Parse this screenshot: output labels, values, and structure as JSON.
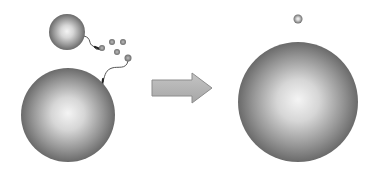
{
  "diagram": {
    "title": "",
    "colors": {
      "background": "#ffffff",
      "sphere_center": "#f2f2f2",
      "sphere_edge": "#6e6e6e",
      "arrow_fill": "#b4b4b4",
      "arrow_stroke": "#8c8c8c",
      "tether": "#555555",
      "small_dot": "#7a7a7a"
    },
    "left_panel": {
      "small_sphere": {
        "cx": 67,
        "cy": 32,
        "r": 18
      },
      "large_sphere": {
        "cx": 68,
        "cy": 115,
        "r": 47
      },
      "free_dots": [
        {
          "cx": 112,
          "cy": 42,
          "r": 3
        },
        {
          "cx": 123,
          "cy": 42,
          "r": 3
        },
        {
          "cx": 117,
          "cy": 52,
          "r": 3
        },
        {
          "cx": 128,
          "cy": 58,
          "r": 3.5
        }
      ]
    },
    "arrow": {
      "label": "",
      "direction": "right"
    },
    "right_panel": {
      "small_sphere": {
        "cx": 298,
        "cy": 19,
        "r": 4
      },
      "large_sphere": {
        "cx": 298,
        "cy": 102,
        "r": 60
      }
    }
  }
}
